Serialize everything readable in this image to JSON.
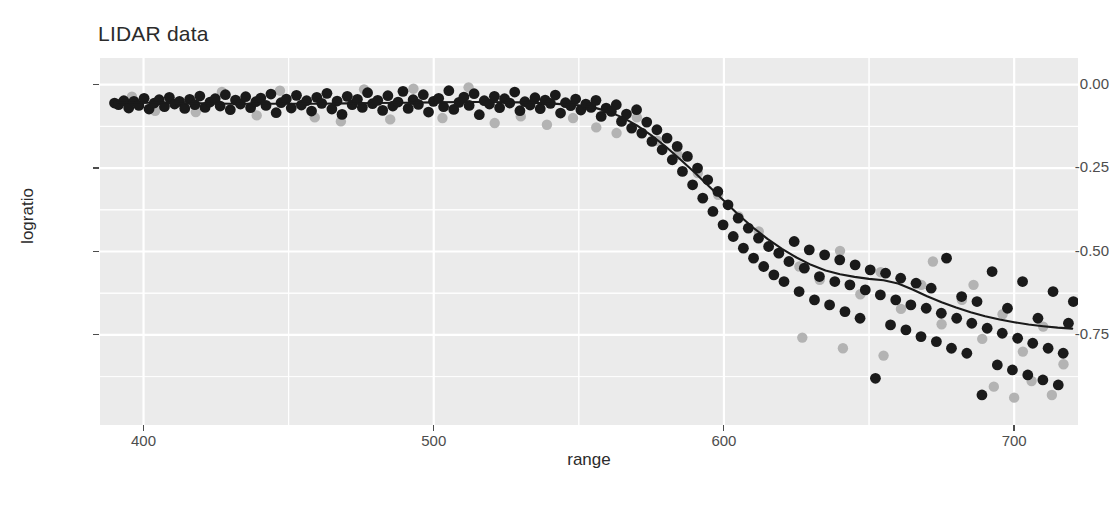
{
  "chart_data": {
    "type": "scatter",
    "title": "LIDAR data",
    "xlabel": "range",
    "ylabel": "logratio",
    "xlim": [
      385,
      722
    ],
    "ylim": [
      -1.02,
      0.08
    ],
    "xticks": [
      400,
      500,
      600,
      700
    ],
    "xtick_labels": [
      "400",
      "500",
      "600",
      "700"
    ],
    "yticks": [
      0.0,
      -0.25,
      -0.5,
      -0.75
    ],
    "ytick_labels": [
      "0.00",
      "-0.25",
      "-0.50",
      "-0.75"
    ],
    "grid": true,
    "minor_grid": true,
    "legend": "none",
    "panel_background": "#ebebeb",
    "grid_color": "#ffffff",
    "point_color": "#1a1a1a",
    "point_color_secondary": "#b3b3b3",
    "line_color": "#1a1a1a",
    "series": [
      {
        "name": "observations",
        "marker": "circle",
        "points": [
          [
            390.0,
            -0.055
          ],
          [
            391.4,
            -0.06
          ],
          [
            393.2,
            -0.048
          ],
          [
            394.9,
            -0.07
          ],
          [
            396.7,
            -0.05
          ],
          [
            398.4,
            -0.062
          ],
          [
            400.2,
            -0.041
          ],
          [
            401.9,
            -0.073
          ],
          [
            403.7,
            -0.055
          ],
          [
            405.4,
            -0.045
          ],
          [
            407.2,
            -0.066
          ],
          [
            408.9,
            -0.038
          ],
          [
            410.7,
            -0.058
          ],
          [
            412.4,
            -0.05
          ],
          [
            414.2,
            -0.071
          ],
          [
            415.9,
            -0.044
          ],
          [
            417.7,
            -0.06
          ],
          [
            419.4,
            -0.034
          ],
          [
            421.2,
            -0.068
          ],
          [
            422.9,
            -0.052
          ],
          [
            424.7,
            -0.042
          ],
          [
            426.4,
            -0.064
          ],
          [
            428.2,
            -0.03
          ],
          [
            429.9,
            -0.075
          ],
          [
            431.7,
            -0.046
          ],
          [
            433.4,
            -0.058
          ],
          [
            435.2,
            -0.036
          ],
          [
            436.9,
            -0.069
          ],
          [
            438.7,
            -0.051
          ],
          [
            440.4,
            -0.04
          ],
          [
            442.2,
            -0.062
          ],
          [
            443.9,
            -0.028
          ],
          [
            445.7,
            -0.084
          ],
          [
            447.4,
            -0.054
          ],
          [
            449.2,
            -0.043
          ],
          [
            450.9,
            -0.07
          ],
          [
            452.7,
            -0.032
          ],
          [
            454.4,
            -0.061
          ],
          [
            456.2,
            -0.048
          ],
          [
            457.9,
            -0.079
          ],
          [
            459.7,
            -0.038
          ],
          [
            461.4,
            -0.056
          ],
          [
            463.2,
            -0.026
          ],
          [
            464.9,
            -0.073
          ],
          [
            466.7,
            -0.049
          ],
          [
            468.4,
            -0.089
          ],
          [
            470.2,
            -0.035
          ],
          [
            471.9,
            -0.06
          ],
          [
            473.7,
            -0.044
          ],
          [
            475.4,
            -0.068
          ],
          [
            477.2,
            -0.024
          ],
          [
            478.9,
            -0.057
          ],
          [
            480.7,
            -0.047
          ],
          [
            482.4,
            -0.077
          ],
          [
            484.2,
            -0.033
          ],
          [
            485.9,
            -0.064
          ],
          [
            487.7,
            -0.052
          ],
          [
            489.4,
            -0.02
          ],
          [
            491.2,
            -0.071
          ],
          [
            492.9,
            -0.045
          ],
          [
            494.7,
            -0.059
          ],
          [
            496.4,
            -0.03
          ],
          [
            498.2,
            -0.082
          ],
          [
            499.9,
            -0.05
          ],
          [
            501.7,
            -0.041
          ],
          [
            503.4,
            -0.066
          ],
          [
            505.2,
            -0.018
          ],
          [
            506.9,
            -0.074
          ],
          [
            508.7,
            -0.053
          ],
          [
            510.4,
            -0.037
          ],
          [
            512.2,
            -0.062
          ],
          [
            513.9,
            -0.027
          ],
          [
            515.7,
            -0.09
          ],
          [
            517.4,
            -0.048
          ],
          [
            519.2,
            -0.058
          ],
          [
            520.9,
            -0.035
          ],
          [
            522.7,
            -0.069
          ],
          [
            524.4,
            -0.042
          ],
          [
            526.2,
            -0.055
          ],
          [
            527.9,
            -0.022
          ],
          [
            529.7,
            -0.078
          ],
          [
            531.4,
            -0.051
          ],
          [
            533.2,
            -0.061
          ],
          [
            534.9,
            -0.039
          ],
          [
            536.7,
            -0.072
          ],
          [
            538.4,
            -0.046
          ],
          [
            540.2,
            -0.056
          ],
          [
            541.9,
            -0.031
          ],
          [
            543.7,
            -0.085
          ],
          [
            545.4,
            -0.054
          ],
          [
            547.2,
            -0.063
          ],
          [
            548.9,
            -0.043
          ],
          [
            550.7,
            -0.076
          ],
          [
            552.4,
            -0.058
          ],
          [
            554.2,
            -0.068
          ],
          [
            555.9,
            -0.047
          ],
          [
            557.7,
            -0.095
          ],
          [
            559.4,
            -0.07
          ],
          [
            561.2,
            -0.08
          ],
          [
            562.9,
            -0.06
          ],
          [
            564.7,
            -0.11
          ],
          [
            566.4,
            -0.088
          ],
          [
            568.2,
            -0.13
          ],
          [
            569.9,
            -0.075
          ],
          [
            571.7,
            -0.145
          ],
          [
            573.4,
            -0.112
          ],
          [
            575.2,
            -0.17
          ],
          [
            576.9,
            -0.135
          ],
          [
            578.7,
            -0.195
          ],
          [
            580.4,
            -0.16
          ],
          [
            582.2,
            -0.225
          ],
          [
            583.9,
            -0.185
          ],
          [
            585.7,
            -0.26
          ],
          [
            587.4,
            -0.215
          ],
          [
            589.2,
            -0.3
          ],
          [
            590.9,
            -0.25
          ],
          [
            592.7,
            -0.34
          ],
          [
            594.4,
            -0.285
          ],
          [
            596.2,
            -0.38
          ],
          [
            597.9,
            -0.32
          ],
          [
            599.7,
            -0.42
          ],
          [
            601.4,
            -0.36
          ],
          [
            603.2,
            -0.455
          ],
          [
            604.9,
            -0.4
          ],
          [
            606.7,
            -0.49
          ],
          [
            608.4,
            -0.43
          ],
          [
            610.2,
            -0.52
          ],
          [
            611.9,
            -0.46
          ],
          [
            613.7,
            -0.545
          ],
          [
            615.4,
            -0.485
          ],
          [
            617.2,
            -0.57
          ],
          [
            618.9,
            -0.505
          ],
          [
            620.7,
            -0.59
          ],
          [
            622.4,
            -0.53
          ],
          [
            624.2,
            -0.47
          ],
          [
            625.9,
            -0.62
          ],
          [
            627.7,
            -0.55
          ],
          [
            629.4,
            -0.495
          ],
          [
            631.2,
            -0.645
          ],
          [
            632.9,
            -0.575
          ],
          [
            634.7,
            -0.51
          ],
          [
            636.4,
            -0.66
          ],
          [
            638.2,
            -0.59
          ],
          [
            639.9,
            -0.525
          ],
          [
            641.7,
            -0.68
          ],
          [
            643.4,
            -0.6
          ],
          [
            645.2,
            -0.54
          ],
          [
            646.9,
            -0.7
          ],
          [
            648.7,
            -0.615
          ],
          [
            650.4,
            -0.555
          ],
          [
            652.2,
            -0.88
          ],
          [
            653.9,
            -0.63
          ],
          [
            655.7,
            -0.565
          ],
          [
            657.4,
            -0.72
          ],
          [
            659.2,
            -0.645
          ],
          [
            660.9,
            -0.58
          ],
          [
            662.7,
            -0.735
          ],
          [
            664.4,
            -0.66
          ],
          [
            666.2,
            -0.595
          ],
          [
            667.9,
            -0.755
          ],
          [
            669.7,
            -0.67
          ],
          [
            671.4,
            -0.61
          ],
          [
            673.2,
            -0.77
          ],
          [
            674.9,
            -0.685
          ],
          [
            676.7,
            -0.52
          ],
          [
            678.4,
            -0.79
          ],
          [
            680.2,
            -0.7
          ],
          [
            681.9,
            -0.635
          ],
          [
            683.7,
            -0.805
          ],
          [
            685.4,
            -0.715
          ],
          [
            687.2,
            -0.65
          ],
          [
            688.9,
            -0.93
          ],
          [
            690.7,
            -0.73
          ],
          [
            692.4,
            -0.56
          ],
          [
            694.2,
            -0.84
          ],
          [
            695.9,
            -0.745
          ],
          [
            697.7,
            -0.67
          ],
          [
            699.4,
            -0.855
          ],
          [
            701.2,
            -0.76
          ],
          [
            702.9,
            -0.59
          ],
          [
            704.7,
            -0.87
          ],
          [
            706.4,
            -0.775
          ],
          [
            708.2,
            -0.7
          ],
          [
            709.9,
            -0.885
          ],
          [
            711.7,
            -0.79
          ],
          [
            713.4,
            -0.62
          ],
          [
            715.2,
            -0.9
          ],
          [
            716.9,
            -0.805
          ],
          [
            718.7,
            -0.715
          ],
          [
            720.4,
            -0.65
          ]
        ]
      },
      {
        "name": "observations-secondary",
        "marker": "circle",
        "points": [
          [
            396.0,
            -0.036
          ],
          [
            404.0,
            -0.078
          ],
          [
            418.0,
            -0.082
          ],
          [
            427.0,
            -0.022
          ],
          [
            439.0,
            -0.092
          ],
          [
            447.0,
            -0.018
          ],
          [
            459.0,
            -0.098
          ],
          [
            468.0,
            -0.11
          ],
          [
            476.0,
            -0.014
          ],
          [
            485.0,
            -0.104
          ],
          [
            493.0,
            -0.012
          ],
          [
            503.0,
            -0.1
          ],
          [
            512.0,
            -0.008
          ],
          [
            521.0,
            -0.115
          ],
          [
            530.0,
            -0.095
          ],
          [
            539.0,
            -0.12
          ],
          [
            548.0,
            -0.1
          ],
          [
            556.0,
            -0.128
          ],
          [
            563.0,
            -0.145
          ],
          [
            570.0,
            -0.098
          ],
          [
            577.0,
            -0.168
          ],
          [
            584.0,
            -0.21
          ],
          [
            591.0,
            -0.265
          ],
          [
            598.0,
            -0.33
          ],
          [
            605.0,
            -0.395
          ],
          [
            612.0,
            -0.44
          ],
          [
            619.0,
            -0.505
          ],
          [
            626.0,
            -0.545
          ],
          [
            633.0,
            -0.585
          ],
          [
            640.0,
            -0.498
          ],
          [
            647.0,
            -0.628
          ],
          [
            654.0,
            -0.562
          ],
          [
            661.0,
            -0.672
          ],
          [
            668.0,
            -0.6
          ],
          [
            675.0,
            -0.718
          ],
          [
            682.0,
            -0.645
          ],
          [
            689.0,
            -0.762
          ],
          [
            696.0,
            -0.688
          ],
          [
            703.0,
            -0.8
          ],
          [
            710.0,
            -0.725
          ],
          [
            717.0,
            -0.838
          ],
          [
            627.0,
            -0.758
          ],
          [
            641.0,
            -0.79
          ],
          [
            655.0,
            -0.812
          ],
          [
            693.0,
            -0.905
          ],
          [
            706.0,
            -0.888
          ],
          [
            713.0,
            -0.93
          ],
          [
            700.0,
            -0.938
          ],
          [
            686.0,
            -0.6
          ],
          [
            672.0,
            -0.53
          ]
        ]
      }
    ],
    "smooth_line": {
      "name": "loess-fit",
      "points": [
        [
          390,
          -0.052
        ],
        [
          400,
          -0.054
        ],
        [
          410,
          -0.055
        ],
        [
          420,
          -0.056
        ],
        [
          430,
          -0.057
        ],
        [
          440,
          -0.057
        ],
        [
          450,
          -0.057
        ],
        [
          460,
          -0.057
        ],
        [
          470,
          -0.056
        ],
        [
          480,
          -0.055
        ],
        [
          490,
          -0.054
        ],
        [
          500,
          -0.053
        ],
        [
          510,
          -0.052
        ],
        [
          520,
          -0.052
        ],
        [
          530,
          -0.053
        ],
        [
          540,
          -0.056
        ],
        [
          550,
          -0.062
        ],
        [
          555,
          -0.068
        ],
        [
          560,
          -0.08
        ],
        [
          565,
          -0.098
        ],
        [
          570,
          -0.122
        ],
        [
          575,
          -0.152
        ],
        [
          580,
          -0.186
        ],
        [
          585,
          -0.224
        ],
        [
          590,
          -0.264
        ],
        [
          595,
          -0.306
        ],
        [
          600,
          -0.348
        ],
        [
          605,
          -0.39
        ],
        [
          610,
          -0.428
        ],
        [
          615,
          -0.462
        ],
        [
          620,
          -0.492
        ],
        [
          625,
          -0.518
        ],
        [
          630,
          -0.54
        ],
        [
          635,
          -0.557
        ],
        [
          640,
          -0.568
        ],
        [
          645,
          -0.576
        ],
        [
          650,
          -0.582
        ],
        [
          655,
          -0.586
        ],
        [
          660,
          -0.596
        ],
        [
          665,
          -0.614
        ],
        [
          670,
          -0.634
        ],
        [
          675,
          -0.652
        ],
        [
          680,
          -0.668
        ],
        [
          685,
          -0.682
        ],
        [
          690,
          -0.694
        ],
        [
          695,
          -0.704
        ],
        [
          700,
          -0.712
        ],
        [
          705,
          -0.719
        ],
        [
          710,
          -0.724
        ],
        [
          715,
          -0.728
        ],
        [
          720,
          -0.731
        ]
      ]
    }
  }
}
